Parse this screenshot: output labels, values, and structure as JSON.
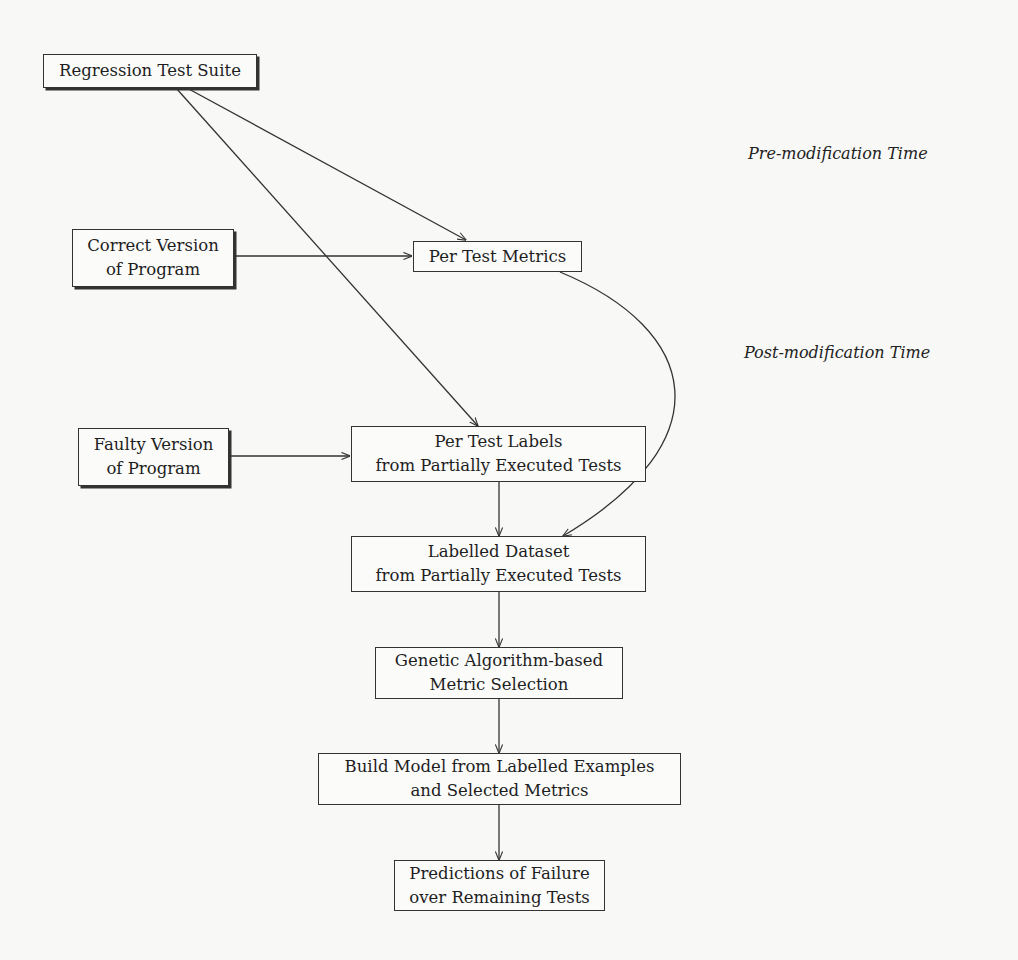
{
  "diagram": {
    "type": "flowchart",
    "nodes": {
      "regression_suite": {
        "lines": [
          "Regression Test Suite"
        ]
      },
      "correct_version": {
        "lines": [
          "Correct Version",
          "of Program"
        ]
      },
      "per_test_metrics": {
        "lines": [
          "Per Test Metrics"
        ]
      },
      "faulty_version": {
        "lines": [
          "Faulty Version",
          "of Program"
        ]
      },
      "per_test_labels": {
        "lines": [
          "Per Test Labels",
          "from Partially Executed Tests"
        ]
      },
      "labelled_dataset": {
        "lines": [
          "Labelled Dataset",
          "from Partially Executed Tests"
        ]
      },
      "ga_selection": {
        "lines": [
          "Genetic Algorithm-based",
          "Metric Selection"
        ]
      },
      "build_model": {
        "lines": [
          "Build Model from Labelled Examples",
          "and Selected Metrics"
        ]
      },
      "predictions": {
        "lines": [
          "Predictions of Failure",
          "over Remaining Tests"
        ]
      }
    },
    "phase_labels": {
      "pre": "Pre-modification Time",
      "post": "Post-modification Time"
    },
    "edges": [
      {
        "from": "regression_suite",
        "to": "per_test_metrics"
      },
      {
        "from": "regression_suite",
        "to": "per_test_labels"
      },
      {
        "from": "correct_version",
        "to": "per_test_metrics"
      },
      {
        "from": "faulty_version",
        "to": "per_test_labels"
      },
      {
        "from": "per_test_metrics",
        "to": "labelled_dataset"
      },
      {
        "from": "per_test_labels",
        "to": "labelled_dataset"
      },
      {
        "from": "labelled_dataset",
        "to": "ga_selection"
      },
      {
        "from": "ga_selection",
        "to": "build_model"
      },
      {
        "from": "build_model",
        "to": "predictions"
      }
    ]
  }
}
